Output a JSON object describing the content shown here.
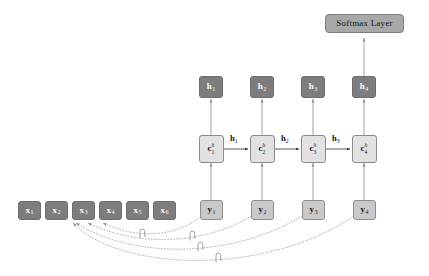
{
  "figure": {
    "background_color": "#ffffff"
  },
  "palette": {
    "dark_node_fill": "#7d7d7d",
    "dark_node_text": "#ffffff",
    "light_node_fill": "#c9c9c9",
    "cell_node_fill": "#e2e2e2",
    "softmax_fill": "#a8a8a8",
    "edge_color": "#9a9a9a",
    "dotted_edge_color": "#a5a5a5",
    "text_color": "#141414"
  },
  "softmax": {
    "label": "Softmax Layer"
  },
  "input_nodes": [
    {
      "base": "x",
      "sub": "1",
      "label": "x1"
    },
    {
      "base": "x",
      "sub": "2",
      "label": "x2"
    },
    {
      "base": "x",
      "sub": "3",
      "label": "x3"
    },
    {
      "base": "x",
      "sub": "4",
      "label": "x4"
    },
    {
      "base": "x",
      "sub": "5",
      "label": "x5"
    },
    {
      "base": "x",
      "sub": "6",
      "label": "x6"
    }
  ],
  "output_nodes": [
    {
      "base": "y",
      "sub": "1",
      "label": "y1"
    },
    {
      "base": "y",
      "sub": "2",
      "label": "y2"
    },
    {
      "base": "y",
      "sub": "3",
      "label": "y3"
    },
    {
      "base": "y",
      "sub": "4",
      "label": "y4"
    }
  ],
  "cell_nodes": [
    {
      "base": "c",
      "sup": "h",
      "sub": "1",
      "label": "c^h_1"
    },
    {
      "base": "c",
      "sup": "h",
      "sub": "2",
      "label": "c^h_2"
    },
    {
      "base": "c",
      "sup": "h",
      "sub": "3",
      "label": "c^h_3"
    },
    {
      "base": "c",
      "sup": "h",
      "sub": "4",
      "label": "c^h_4"
    }
  ],
  "hidden_nodes": [
    {
      "base": "h",
      "sub": "1",
      "label": "h1"
    },
    {
      "base": "h",
      "sub": "2",
      "label": "h2"
    },
    {
      "base": "h",
      "sub": "3",
      "label": "h3"
    },
    {
      "base": "h",
      "sub": "4",
      "label": "h4"
    }
  ],
  "recurrent_edge_labels": [
    {
      "base": "h",
      "sub": "1",
      "label": "h1"
    },
    {
      "base": "h",
      "sub": "2",
      "label": "h2"
    },
    {
      "base": "h",
      "sub": "3",
      "label": "h3"
    }
  ],
  "alignment_links": [
    {
      "from": "y1",
      "to": "x5"
    },
    {
      "from": "y2",
      "to": "x4"
    },
    {
      "from": "y3",
      "to": "x3"
    },
    {
      "from": "y4",
      "to": "x3"
    }
  ]
}
